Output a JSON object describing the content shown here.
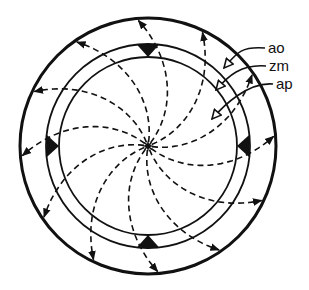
{
  "diagram": {
    "type": "radial-flow-diagram",
    "center": {
      "x": 148,
      "y": 146
    },
    "rings": [
      {
        "id": "outer",
        "radius": 128,
        "stroke_width": 3
      },
      {
        "id": "middle",
        "radius": 102,
        "stroke_width": 1.8
      },
      {
        "id": "inner",
        "radius": 89,
        "stroke_width": 1.8
      }
    ],
    "wedges": [
      {
        "position": "top",
        "angle_deg": -90
      },
      {
        "position": "right",
        "angle_deg": 0
      },
      {
        "position": "bottom",
        "angle_deg": 90
      },
      {
        "position": "left",
        "angle_deg": 180
      }
    ],
    "spiral_arrow_count": 12,
    "colors": {
      "ink": "#111111",
      "background": "#ffffff"
    },
    "labels": [
      {
        "text": "ao",
        "x": 268,
        "y": 53,
        "target_x": 224,
        "target_y": 68
      },
      {
        "text": "zm",
        "x": 269,
        "y": 71,
        "target_x": 216,
        "target_y": 90
      },
      {
        "text": "ap",
        "x": 276,
        "y": 89,
        "target_x": 212,
        "target_y": 119
      }
    ]
  }
}
